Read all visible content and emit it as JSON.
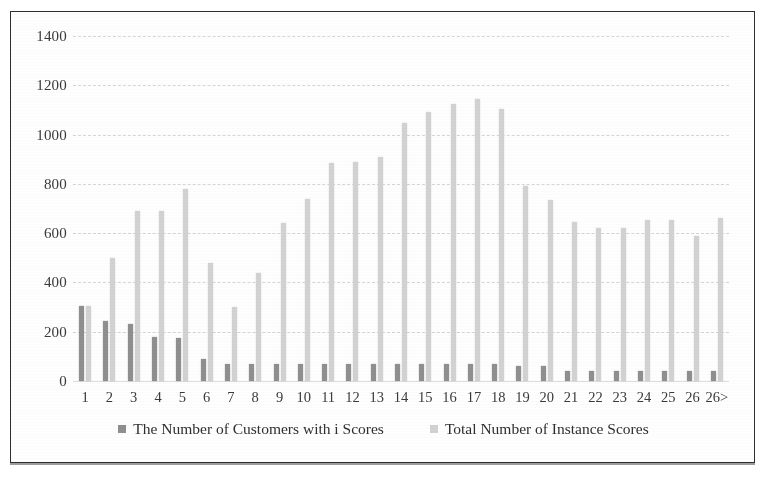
{
  "chart_data": {
    "type": "bar",
    "title": "",
    "xlabel": "",
    "ylabel": "",
    "ylim": [
      0,
      1400
    ],
    "ytick_step": 200,
    "yticks": [
      1400,
      1200,
      1000,
      800,
      600,
      400,
      200,
      0
    ],
    "grid": true,
    "legend_position": "bottom",
    "categories": [
      "1",
      "2",
      "3",
      "4",
      "5",
      "6",
      "7",
      "8",
      "9",
      "10",
      "11",
      "12",
      "13",
      "14",
      "15",
      "16",
      "17",
      "18",
      "19",
      "20",
      "21",
      "22",
      "23",
      "24",
      "25",
      "26",
      "26>"
    ],
    "series": [
      {
        "name": "The Number of Customers with i Scores",
        "color": "#8f8f8f",
        "values": [
          305,
          245,
          230,
          180,
          175,
          90,
          70,
          70,
          70,
          70,
          70,
          70,
          70,
          70,
          70,
          70,
          70,
          70,
          60,
          60,
          40,
          40,
          40,
          40,
          40,
          40,
          40
        ]
      },
      {
        "name": "Total Number of Instance Scores",
        "color": "#d2d2d2",
        "values": [
          305,
          500,
          690,
          690,
          780,
          480,
          300,
          440,
          640,
          740,
          885,
          890,
          910,
          1045,
          1090,
          1125,
          1145,
          1105,
          790,
          735,
          645,
          620,
          620,
          655,
          655,
          590,
          660
        ]
      }
    ]
  },
  "legend": {
    "items": [
      {
        "label": "The Number of Customers with i Scores"
      },
      {
        "label": "Total Number of Instance Scores"
      }
    ]
  }
}
